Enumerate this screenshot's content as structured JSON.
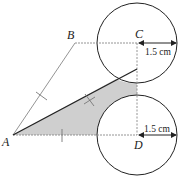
{
  "labels": {
    "A": "A",
    "B": "B",
    "C": "C",
    "D": "D"
  },
  "measurements": {
    "radius_top": "1.5 cm",
    "radius_bottom": "1.5 cm"
  },
  "colors": {
    "shading": "#cfcfcf",
    "line": "#222222",
    "thin_line": "#777777"
  }
}
